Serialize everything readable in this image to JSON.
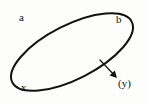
{
  "figure": {
    "type": "geometry-diagram",
    "width": 147,
    "height": 104,
    "background_color": "#fdfdfc",
    "stroke_color": "#121212"
  },
  "shape": {
    "name": "ellipse",
    "center_x": 72,
    "center_y": 52,
    "semi_major": 67,
    "semi_minor": 27,
    "rotation_degrees": -27,
    "stroke_width": 2
  },
  "labels": {
    "a": "a",
    "b": "b",
    "x": "x",
    "y": "(y)"
  },
  "annotation": {
    "arrow": {
      "name": "pointer-arrow",
      "from_x": 100,
      "from_y": 60,
      "to_x": 117,
      "to_y": 78,
      "stroke_width": 1.2,
      "head": "filled-triangle"
    }
  }
}
